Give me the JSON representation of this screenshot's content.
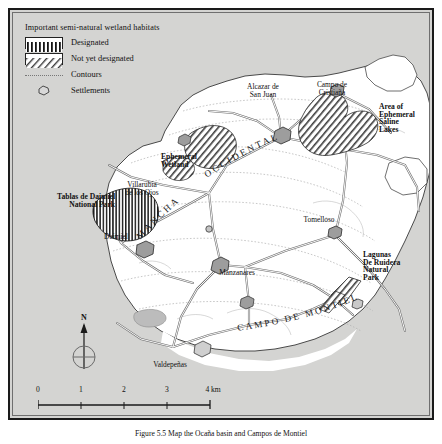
{
  "figure": {
    "caption": "Figure 5.5  Map the Ocaña basin and Campos de Montiel"
  },
  "legend": {
    "title": "Important semi-natural wetland habitats",
    "items": [
      {
        "label": "Designated",
        "symbol": "vertical-hatch-swatch"
      },
      {
        "label": "Not yet designated",
        "symbol": "diagonal-hatch-swatch"
      },
      {
        "label": "Contours",
        "symbol": "dotted-line"
      },
      {
        "label": "Settlements",
        "symbol": "settlement-polygon"
      }
    ]
  },
  "compass": {
    "north_label": "N"
  },
  "scale": {
    "ticks": [
      "0",
      "1",
      "2",
      "3",
      "4 km"
    ],
    "unit": "km"
  },
  "map": {
    "settlements": [
      {
        "name": "Alcazar de\nSan Juan",
        "x": 248,
        "y": 78
      },
      {
        "name": "Campo de\nCristiaña",
        "x": 318,
        "y": 76
      },
      {
        "name": "Villarubia\nde los Ojos",
        "x": 128,
        "y": 177
      },
      {
        "name": "Daimiel",
        "x": 103,
        "y": 227
      },
      {
        "name": "Tomelloso",
        "x": 303,
        "y": 209
      },
      {
        "name": "Manzanares",
        "x": 222,
        "y": 261
      },
      {
        "name": "Valdeñpeñas",
        "x": 158,
        "y": 355
      }
    ],
    "settlement_labels": [
      "Alcazar de\nSan Juan",
      "Campo de\nCristiaña",
      "Villarubia\nde los Ojos",
      "Daimiel",
      "Tomelloso",
      "Manzanares",
      "Valdepeñas"
    ],
    "protected_areas": [
      {
        "name": "Tablas de Daimiel\nNational Park",
        "type": "designated"
      },
      {
        "name": "Ephemeral\nWetland",
        "type": "not-yet-designated"
      },
      {
        "name": "Area of\nEphemeral\nSaline\nLakes",
        "type": "not-yet-designated"
      },
      {
        "name": "Lagunas\nDe Ruidera\nNatural\nPark",
        "type": "not-yet-designated"
      }
    ],
    "regions": [
      {
        "name": "MANCHA",
        "style": "curved-spaced"
      },
      {
        "name": "OCCIDENTAL",
        "style": "curved-spaced"
      },
      {
        "name": "CAMPO DE MONTIEL",
        "style": "curved-spaced"
      }
    ],
    "region_mancha": "MANCHA",
    "region_occidental": "OCCIDENTAL",
    "region_campo_montiel": "CAMPO DE MONTIEL"
  },
  "colors": {
    "outside_fill": "#d4d4d2",
    "basin_fill": "#ffffff",
    "frame": "#1a1a1a",
    "road": "#8a8a8a",
    "contour": "#a9a9a9",
    "text": "#111111"
  }
}
